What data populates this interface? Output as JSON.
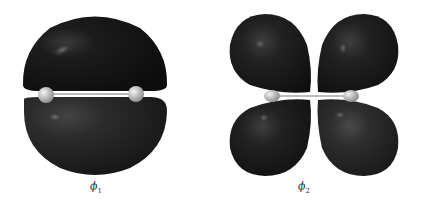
{
  "figures": [
    {
      "id": "phi1",
      "label_symbol": "ϕ",
      "label_subscript": "1",
      "description": "Bonding pi orbital: two lobes above and below the bond axis",
      "lobe_color_top": "#161616",
      "lobe_color_bottom": "#2b2b2b"
    },
    {
      "id": "phi2",
      "label_symbol": "ϕ",
      "label_subscript": "2",
      "description": "Antibonding pi orbital: four lobes with a node between atoms",
      "lobe_color_dark": "#1a1a1a",
      "lobe_color_light": "#2e2e2e"
    }
  ],
  "atom_color": "#d8d8d8",
  "bond_color": "#bbbbbb"
}
